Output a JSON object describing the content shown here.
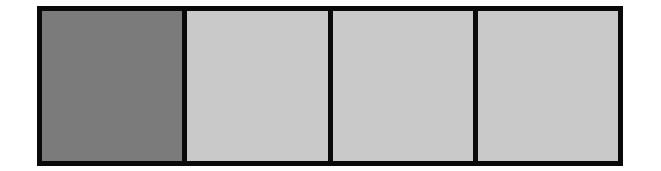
{
  "strip": {
    "border_color": "#0a0a0a",
    "cells": [
      {
        "state": "filled",
        "color": "#7b7b7b"
      },
      {
        "state": "empty",
        "color": "#c9c9c9"
      },
      {
        "state": "empty",
        "color": "#c9c9c9"
      },
      {
        "state": "empty",
        "color": "#c9c9c9"
      }
    ]
  }
}
